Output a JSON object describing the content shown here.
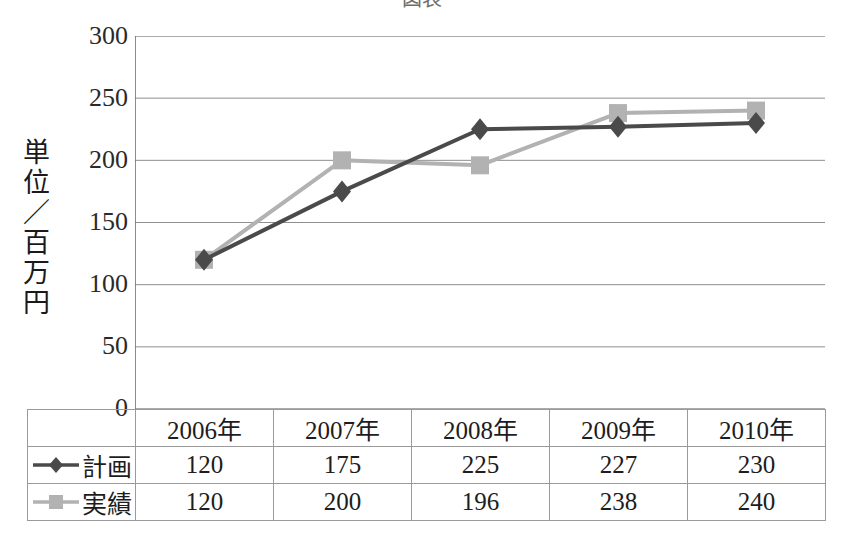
{
  "chart_data": {
    "type": "line",
    "title": "図表",
    "categories": [
      "2006年",
      "2007年",
      "2008年",
      "2009年",
      "2010年"
    ],
    "series": [
      {
        "name": "計画",
        "marker": "diamond",
        "color": "#4a4a4a",
        "values": [
          120,
          175,
          225,
          227,
          230
        ]
      },
      {
        "name": "実績",
        "marker": "square",
        "color": "#b2b2b2",
        "values": [
          120,
          200,
          196,
          238,
          240
        ]
      }
    ],
    "ylabel": "単位／百万円",
    "ylabel_chars": [
      "単",
      "位",
      "／",
      "百",
      "万",
      "円"
    ],
    "xlabel": "",
    "ylim": [
      0,
      300
    ],
    "yticks": [
      300,
      250,
      200,
      150,
      100,
      50,
      0
    ],
    "grid": true,
    "legend_position": "table-row-header"
  },
  "axis": {
    "ticks": [
      "300",
      "250",
      "200",
      "150",
      "100",
      "50",
      "0"
    ]
  },
  "table": {
    "header": [
      "",
      "2006年",
      "2007年",
      "2008年",
      "2009年",
      "2010年"
    ],
    "rows": [
      {
        "label": "計画",
        "marker": "diamond",
        "values": [
          "120",
          "175",
          "225",
          "227",
          "230"
        ]
      },
      {
        "label": "実績",
        "marker": "square",
        "values": [
          "120",
          "200",
          "196",
          "238",
          "240"
        ]
      }
    ]
  },
  "colors": {
    "plan_line": "#4a4a4a",
    "actual_line": "#b2b2b2",
    "grid": "#8f8f8f",
    "axis": "#6e6e6e",
    "table_border": "#9a9a9a",
    "text": "#1d1d1d"
  }
}
